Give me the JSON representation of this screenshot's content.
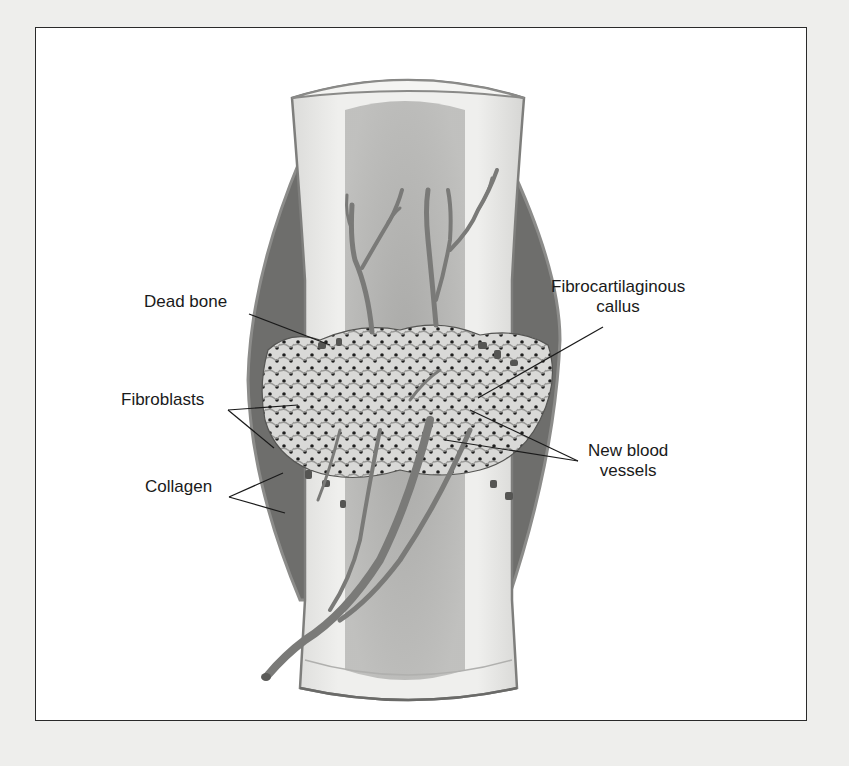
{
  "figure": {
    "type": "anatomical-illustration",
    "colors": {
      "page_background": "#eeeeec",
      "frame_background": "#ffffff",
      "frame_border": "#2a2a2a",
      "bone_cortex": "#ececea",
      "bone_outline": "#8a8a88",
      "marrow": "#a8a8a6",
      "soft_tissue_dark": "#6e6e6c",
      "callus_light": "#d4d4d2",
      "vessel": "#7a7a78",
      "label_text": "#1a1a1a",
      "leader_line": "#1a1a1a"
    }
  },
  "labels": [
    {
      "id": "dead-bone",
      "text": "Dead bone",
      "x": 144,
      "y": 302,
      "leaders": [
        [
          249,
          314,
          330,
          345
        ]
      ]
    },
    {
      "id": "fibrocartilaginous-callus",
      "line1": "Fibrocartilaginous",
      "line2": "callus",
      "x": 551,
      "y": 287,
      "leaders": [
        [
          603,
          327,
          478,
          398
        ]
      ]
    },
    {
      "id": "fibroblasts",
      "text": "Fibroblasts",
      "x": 121,
      "y": 400,
      "leaders": [
        [
          228,
          410,
          298,
          405
        ],
        [
          228,
          410,
          274,
          448
        ]
      ]
    },
    {
      "id": "collagen",
      "text": "Collagen",
      "x": 145,
      "y": 487,
      "leaders": [
        [
          229,
          497,
          283,
          473
        ],
        [
          229,
          497,
          285,
          513
        ]
      ]
    },
    {
      "id": "new-blood-vessels",
      "line1": "New blood",
      "line2": "vessels",
      "x": 588,
      "y": 451,
      "leaders": [
        [
          578,
          461,
          470,
          410
        ],
        [
          578,
          461,
          445,
          440
        ]
      ]
    }
  ]
}
